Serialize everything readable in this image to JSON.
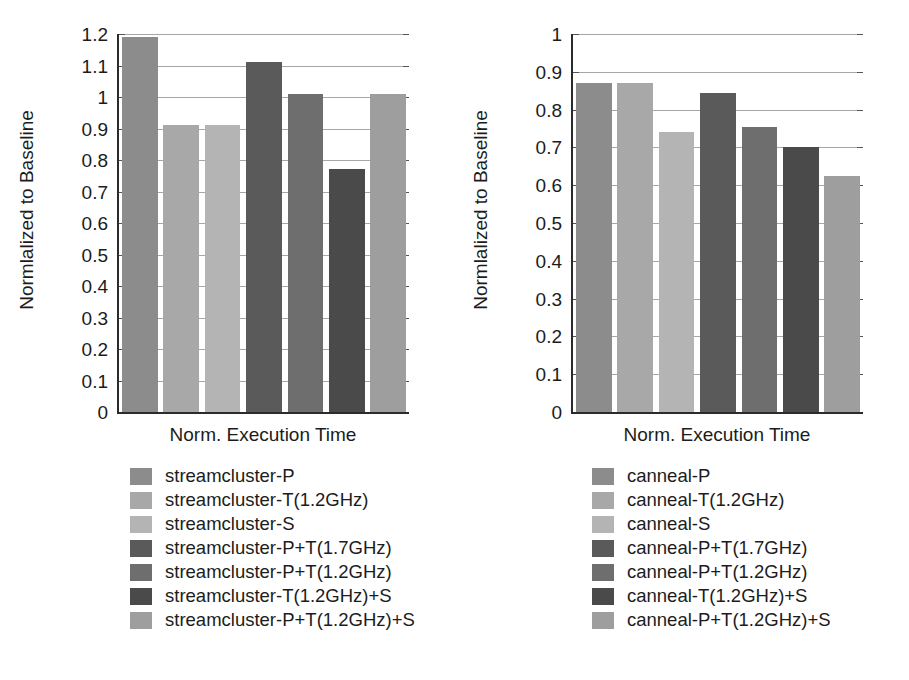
{
  "figure": {
    "panels": [
      {
        "id": "left",
        "ylabel": "Normlalized to Baseline",
        "xlabel": "Norm. Execution Time",
        "yticks": [
          "1.2",
          "1.1",
          "1",
          "0.9",
          "0.8",
          "0.7",
          "0.6",
          "0.5",
          "0.4",
          "0.3",
          "0.2",
          "0.1",
          "0"
        ],
        "legend": [
          {
            "label": "streamcluster-P",
            "color": "#8c8c8c"
          },
          {
            "label": "streamcluster-T(1.2GHz)",
            "color": "#a8a8a8"
          },
          {
            "label": "streamcluster-S",
            "color": "#b4b4b4"
          },
          {
            "label": "streamcluster-P+T(1.7GHz)",
            "color": "#5a5a5a"
          },
          {
            "label": "streamcluster-P+T(1.2GHz)",
            "color": "#6e6e6e"
          },
          {
            "label": "streamcluster-T(1.2GHz)+S",
            "color": "#4a4a4a"
          },
          {
            "label": "streamcluster-P+T(1.2GHz)+S",
            "color": "#9e9e9e"
          }
        ]
      },
      {
        "id": "right",
        "ylabel": "Normlalized to Baseline",
        "xlabel": "Norm. Execution Time",
        "yticks": [
          "1",
          "0.9",
          "0.8",
          "0.7",
          "0.6",
          "0.5",
          "0.4",
          "0.3",
          "0.2",
          "0.1",
          "0"
        ],
        "legend": [
          {
            "label": "canneal-P",
            "color": "#8c8c8c"
          },
          {
            "label": "canneal-T(1.2GHz)",
            "color": "#a8a8a8"
          },
          {
            "label": "canneal-S",
            "color": "#b4b4b4"
          },
          {
            "label": "canneal-P+T(1.7GHz)",
            "color": "#5a5a5a"
          },
          {
            "label": "canneal-P+T(1.2GHz)",
            "color": "#6e6e6e"
          },
          {
            "label": "canneal-T(1.2GHz)+S",
            "color": "#4a4a4a"
          },
          {
            "label": "canneal-P+T(1.2GHz)+S",
            "color": "#9e9e9e"
          }
        ]
      }
    ]
  },
  "chart_data": [
    {
      "type": "bar",
      "title": "",
      "xlabel": "Norm. Execution Time",
      "ylabel": "Normlalized to Baseline",
      "ylim": [
        0,
        1.2
      ],
      "ytick_step": 0.1,
      "grid": true,
      "legend_position": "below",
      "categories": [
        "streamcluster-P",
        "streamcluster-T(1.2GHz)",
        "streamcluster-S",
        "streamcluster-P+T(1.7GHz)",
        "streamcluster-P+T(1.2GHz)",
        "streamcluster-T(1.2GHz)+S",
        "streamcluster-P+T(1.2GHz)+S"
      ],
      "values": [
        1.19,
        0.91,
        0.91,
        1.11,
        1.01,
        0.77,
        1.01
      ],
      "colors": [
        "#8c8c8c",
        "#a8a8a8",
        "#b4b4b4",
        "#5a5a5a",
        "#6e6e6e",
        "#4a4a4a",
        "#9e9e9e"
      ]
    },
    {
      "type": "bar",
      "title": "",
      "xlabel": "Norm. Execution Time",
      "ylabel": "Normlalized to Baseline",
      "ylim": [
        0,
        1.0
      ],
      "ytick_step": 0.1,
      "grid": true,
      "legend_position": "below",
      "categories": [
        "canneal-P",
        "canneal-T(1.2GHz)",
        "canneal-S",
        "canneal-P+T(1.7GHz)",
        "canneal-P+T(1.2GHz)",
        "canneal-T(1.2GHz)+S",
        "canneal-P+T(1.2GHz)+S"
      ],
      "values": [
        0.87,
        0.87,
        0.74,
        0.845,
        0.755,
        0.7,
        0.625
      ],
      "colors": [
        "#8c8c8c",
        "#a8a8a8",
        "#b4b4b4",
        "#5a5a5a",
        "#6e6e6e",
        "#4a4a4a",
        "#9e9e9e"
      ]
    }
  ]
}
